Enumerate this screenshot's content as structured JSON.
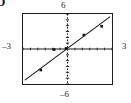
{
  "figure": {
    "corner_glyph": "D",
    "labels": {
      "top": "6",
      "bottom": "–6",
      "left": "–3",
      "right": "3"
    }
  },
  "chart_data": {
    "type": "scatter",
    "title": "",
    "xlabel": "",
    "ylabel": "",
    "xlim": [
      -3,
      3
    ],
    "ylim": [
      -6,
      6
    ],
    "xticks": [
      -3,
      -2.5,
      -2,
      -1.5,
      -1,
      -0.5,
      0,
      0.5,
      1,
      1.5,
      2,
      2.5,
      3
    ],
    "yticks": [
      -6,
      -5,
      -4,
      -3,
      -2,
      -1,
      0,
      1,
      2,
      3,
      4,
      5,
      6
    ],
    "tick_labels": {
      "x": [
        "-3",
        "3"
      ],
      "y": [
        "-6",
        "6"
      ]
    },
    "grid": false,
    "legend": null,
    "axes_style": "dotted-ticks",
    "points": [
      {
        "x": -1.8,
        "y": -3.6
      },
      {
        "x": -0.9,
        "y": -0.1
      },
      {
        "x": -0.1,
        "y": 0.1
      },
      {
        "x": 1.1,
        "y": 2.4
      },
      {
        "x": 2.3,
        "y": 3.9
      }
    ],
    "series": [
      {
        "name": "data points",
        "type": "scatter",
        "x": [
          -1.8,
          -0.9,
          -0.1,
          1.1,
          2.3
        ],
        "y": [
          -3.6,
          -0.1,
          0.1,
          2.4,
          3.9
        ]
      },
      {
        "name": "line of best fit",
        "type": "line",
        "slope": 1.9,
        "intercept": 0.1,
        "endpoints": [
          {
            "x": -2.85,
            "y": -5.3
          },
          {
            "x": 2.85,
            "y": 5.5
          }
        ]
      }
    ]
  }
}
